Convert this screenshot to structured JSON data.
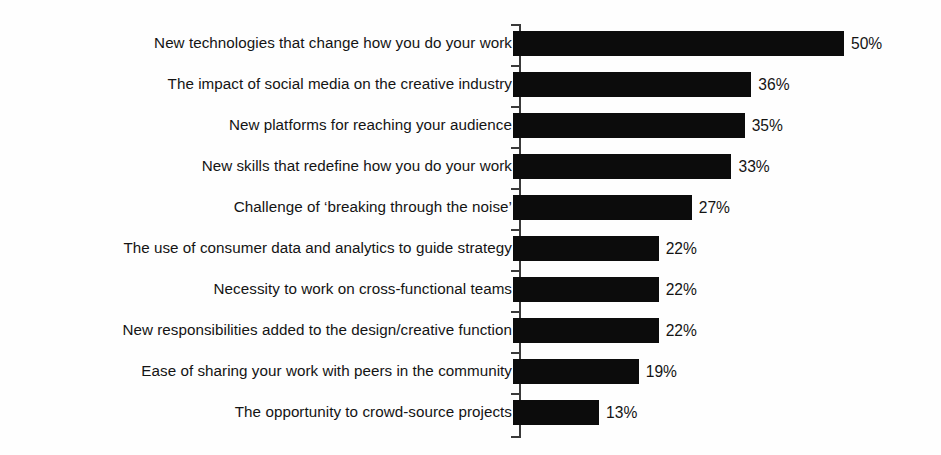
{
  "chart_data": {
    "type": "bar",
    "orientation": "horizontal",
    "title": "",
    "subtitle": "",
    "xlabel": "",
    "ylabel": "",
    "xlim": [
      0,
      50
    ],
    "grid": false,
    "legend": null,
    "value_suffix": "%",
    "bar_color": "#0c0c0c",
    "axis_color": "#3a3a3a",
    "background_color": "#fefefe",
    "categories": [
      "New technologies that change how you do your work",
      "The impact of social media on the creative industry",
      "New platforms for reaching your audience",
      "New skills that redefine how you do your work",
      "Challenge of ‘breaking through the noise’",
      "The use of consumer data and analytics to guide strategy",
      "Necessity to work on cross-functional teams",
      "New responsibilities added to the design/creative function",
      "Ease of sharing your work with peers in the community",
      "The opportunity to crowd-source projects"
    ],
    "values": [
      50,
      36,
      35,
      33,
      27,
      22,
      22,
      22,
      19,
      13
    ],
    "value_labels": [
      "50%",
      "36%",
      "35%",
      "33%",
      "27%",
      "22%",
      "22%",
      "22%",
      "19%",
      "13%"
    ]
  }
}
